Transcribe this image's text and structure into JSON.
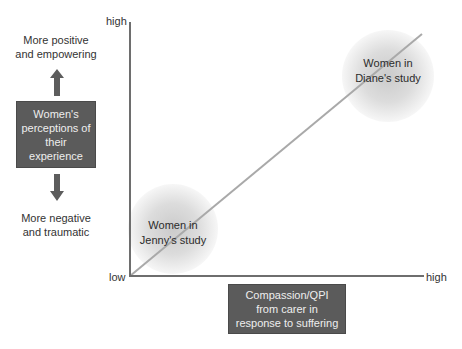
{
  "left_panel": {
    "top_label": [
      "More positive",
      "and empowering"
    ],
    "center_box": [
      "Women's",
      "perceptions of",
      "their",
      "experience"
    ],
    "bottom_label": [
      "More negative",
      "and traumatic"
    ],
    "up_arrow": "arrow-up-icon",
    "down_arrow": "arrow-down-icon"
  },
  "axes": {
    "y_high": "high",
    "origin_low": "low",
    "x_high": "high"
  },
  "x_axis_box": [
    "Compassion/QPI",
    "from carer in",
    "response to suffering"
  ],
  "studies": [
    {
      "lines": [
        "Women in",
        "Jenny's study"
      ],
      "position": "low"
    },
    {
      "lines": [
        "Women in",
        "Diane's study"
      ],
      "position": "high"
    }
  ],
  "colors": {
    "box_fill": "#5b5b5b",
    "axis_line": "#6e6e6e",
    "diagonal_line": "#a8a8a8",
    "blob": "#cfcfcf"
  }
}
